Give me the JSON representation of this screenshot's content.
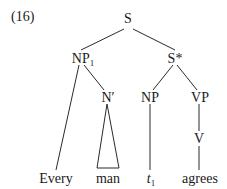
{
  "example_number": "(16)",
  "tree": {
    "root": {
      "label": "S"
    },
    "np1": {
      "label": "NP",
      "subscript": "1"
    },
    "s_star": {
      "label": "S*"
    },
    "n_bar": {
      "label": "N′"
    },
    "np_trace": {
      "label": "NP"
    },
    "vp": {
      "label": "VP"
    },
    "v": {
      "label": "V"
    },
    "leaves": {
      "every": "Every",
      "man": "man",
      "trace": "t",
      "trace_subscript": "1",
      "agrees": "agrees"
    },
    "edges": [
      [
        "S",
        "NP1"
      ],
      [
        "S",
        "S*"
      ],
      [
        "NP1",
        "Every"
      ],
      [
        "NP1",
        "N′"
      ],
      [
        "N′",
        "man (triangle)"
      ],
      [
        "S*",
        "NP"
      ],
      [
        "S*",
        "VP"
      ],
      [
        "NP",
        "t1"
      ],
      [
        "VP",
        "V"
      ],
      [
        "V",
        "agrees"
      ]
    ]
  }
}
